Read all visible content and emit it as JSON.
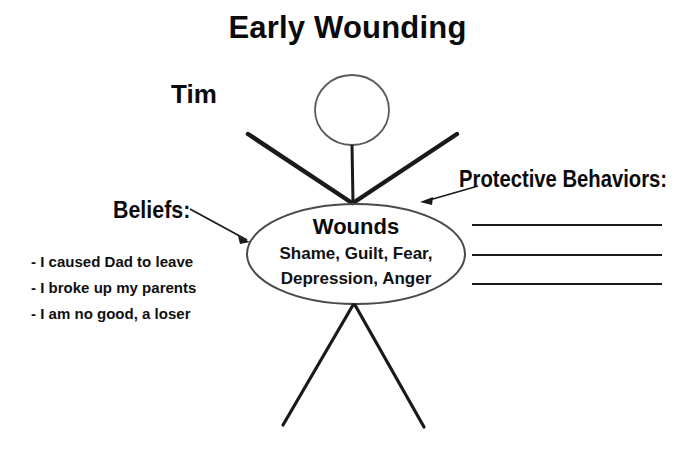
{
  "title": "Early Wounding",
  "person": {
    "name": "Tim"
  },
  "beliefs": {
    "heading": "Beliefs:",
    "items": [
      "- I caused Dad to leave",
      "- I broke up my parents",
      "- I am no good, a loser"
    ]
  },
  "protective_behaviors": {
    "heading": "Protective Behaviors:",
    "blank_lines": [
      "",
      "",
      ""
    ]
  },
  "wounds": {
    "title": "Wounds",
    "line_1": "Shame, Guilt, Fear,",
    "line_2": "Depression, Anger"
  },
  "colors": {
    "ink": "#111111",
    "stroke": "#1a1a1a",
    "ellipse_stroke": "#4a4a4a",
    "background": "#ffffff"
  },
  "icons": {
    "head": "head-circle-icon",
    "arms": "arms-icon",
    "legs": "legs-icon",
    "beliefs_arrow": "arrow-right-icon",
    "protective_arrow": "arrow-left-icon"
  }
}
